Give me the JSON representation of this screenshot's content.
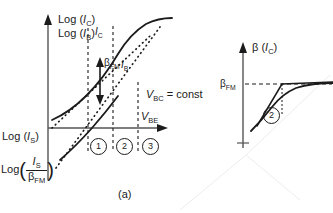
{
  "figure": {
    "caption": "(a)",
    "left_panel": {
      "yaxis_label_line1_prefix": "Log (",
      "yaxis_label_line1_var": "I",
      "yaxis_label_line1_sub": "C",
      "yaxis_label_line2_prefix": "Log (",
      "yaxis_label_line2_var": "I",
      "yaxis_label_line2_sub": "B",
      "xaxis_label_var": "V",
      "xaxis_label_sub": "BE",
      "curve_label_ic_var": "I",
      "curve_label_ic_sub": "C",
      "curve_label_ib_var": "I",
      "curve_label_ib_sub": "B",
      "beta_label": "β",
      "beta_sub": "FM",
      "condition_var": "V",
      "condition_sub": "BC",
      "condition_rest": " = const",
      "origin_label_prefix": "Log (",
      "origin_label_var": "I",
      "origin_label_sub": "S",
      "origin_label_suffix": ")",
      "lower_label_prefix": "Log",
      "lower_label_num_var": "I",
      "lower_label_num_sub": "S",
      "lower_label_den_beta": "β",
      "lower_label_den_sub": "FM",
      "regions": [
        "1",
        "2",
        "3"
      ]
    },
    "right_panel": {
      "yaxis_label_beta": "β",
      "yaxis_label_arg_open": " (",
      "yaxis_label_arg_var": "I",
      "yaxis_label_arg_sub": "C",
      "yaxis_label_arg_close": ")",
      "beta_fm_label": "β",
      "beta_fm_sub": "FM",
      "region_marker": "2"
    },
    "colors": {
      "ink": "#1b1b1b",
      "axis": "#555555",
      "background": "#ffffff",
      "watermark": "#efefef"
    }
  }
}
